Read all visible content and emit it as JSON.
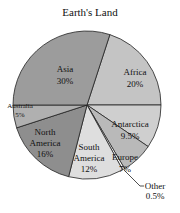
{
  "chart_data": {
    "type": "pie",
    "title": "Earth's Land",
    "unit": "%",
    "start_angle_deg": 18,
    "direction": "clockwise",
    "slices": [
      {
        "label": "Africa",
        "value": 20,
        "display": "20%",
        "color": "#c4c4c4"
      },
      {
        "label": "Antarctica",
        "value": 9.5,
        "display": "9.5%",
        "color": "#cfcfcf"
      },
      {
        "label": "Europe",
        "value": 7,
        "display": "7%",
        "color": "#b9b9b9"
      },
      {
        "label": "Other",
        "value": 0.5,
        "display": "0.5%",
        "color": "#ffffff"
      },
      {
        "label": "South America",
        "value": 12,
        "display": "12%",
        "color": "#dedede"
      },
      {
        "label": "North America",
        "value": 16,
        "display": "16%",
        "color": "#8e8e8e"
      },
      {
        "label": "Australia",
        "value": 5,
        "display": "5%",
        "color": "#b0b0b0"
      },
      {
        "label": "Asia",
        "value": 30,
        "display": "30%",
        "color": "#9c9c9c"
      }
    ]
  }
}
